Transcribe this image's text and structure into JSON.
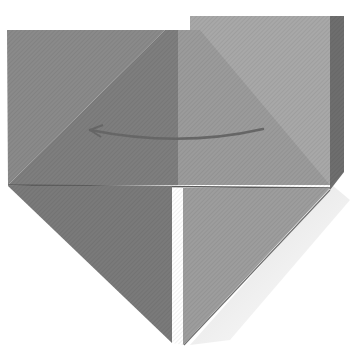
{
  "figure": {
    "title": "Origami folding step: fold right flap over to the left",
    "instruction_arrow": "curved-arrow-pointing-left",
    "colors": {
      "background": "#ffffff",
      "left_outer": "#8a8a8a",
      "left_triangle_upper": "#7d7d7d",
      "left_lower_flap": "#7a7a7a",
      "right_top_square": "#a6a6a6",
      "right_triangle_upper": "#9a9a9a",
      "right_lower_flap": "#9c9c9c",
      "right_edge_shadow": "#6c6c6c",
      "arrow": "#6a6a6a",
      "crease": "#5e5e5e"
    }
  }
}
